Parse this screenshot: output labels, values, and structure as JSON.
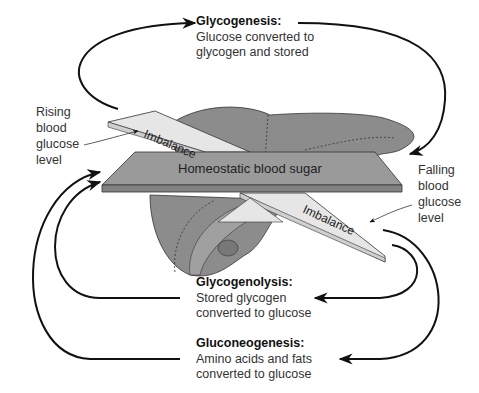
{
  "diagram": {
    "center_plate": {
      "label": "Homeostatic blood sugar"
    },
    "imbalance_top": {
      "label": "Imbalance"
    },
    "imbalance_bottom": {
      "label": "Imbalance"
    },
    "rising": {
      "lines": [
        "Rising",
        "blood",
        "glucose",
        "level"
      ]
    },
    "falling": {
      "lines": [
        "Falling",
        "blood",
        "glucose",
        "level"
      ]
    },
    "glycogenesis": {
      "title": "Glycogenesis:",
      "lines": [
        "Glucose converted to",
        "glycogen and stored"
      ]
    },
    "glycogenolysis": {
      "title": "Glycogenolysis:",
      "lines": [
        "Stored glycogen",
        "converted to glucose"
      ]
    },
    "gluconeogenesis": {
      "title": "Gluconeogenesis:",
      "lines": [
        "Amino acids and fats",
        "converted to glucose"
      ]
    },
    "colors": {
      "liver": "#8c8c8c",
      "plate": "#9a9a9a",
      "imbalance": "#e6e6e6",
      "arrow": "#111111"
    }
  }
}
